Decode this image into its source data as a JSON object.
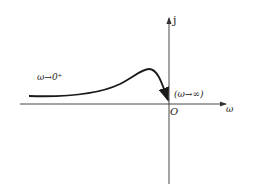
{
  "diagram": {
    "type": "nyquist-plot",
    "axes": {
      "imag_label": "j",
      "real_label": "ω",
      "origin_label": "O"
    },
    "annotations": {
      "start": "ω→0⁺",
      "end": "(ω→∞)"
    },
    "colors": {
      "line": "#1a1a1a",
      "axis": "#333333",
      "background": "#ffffff"
    }
  }
}
